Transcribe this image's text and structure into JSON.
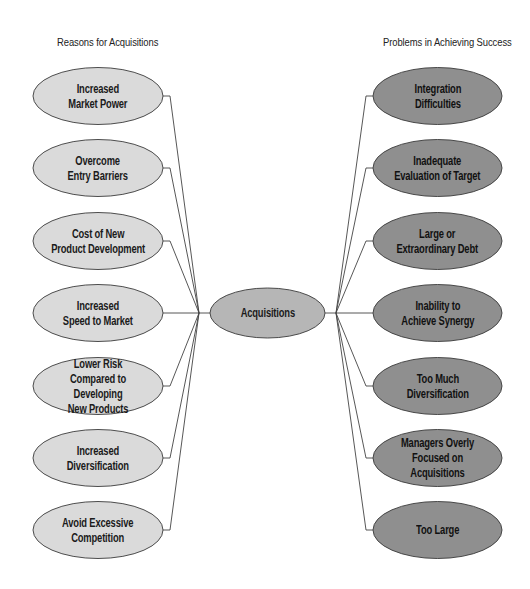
{
  "titles": {
    "left": "Reasons for Acquisitions",
    "right": "Problems in Achieving Success"
  },
  "center": {
    "label": "Acquisitions"
  },
  "colors": {
    "left_fill": "#dadada",
    "right_fill": "#8f8f8f",
    "center_fill": "#b6b6b6",
    "stroke": "#3a3a3a",
    "line": "#444444"
  },
  "left_nodes": [
    {
      "label": "Increased\nMarket Power"
    },
    {
      "label": "Overcome\nEntry Barriers"
    },
    {
      "label": "Cost of New\nProduct Development"
    },
    {
      "label": "Increased\nSpeed to Market"
    },
    {
      "label": "Lower Risk\nCompared to Developing\nNew Products"
    },
    {
      "label": "Increased\nDiversification"
    },
    {
      "label": "Avoid Excessive\nCompetition"
    }
  ],
  "right_nodes": [
    {
      "label": "Integration\nDifficulties"
    },
    {
      "label": "Inadequate\nEvaluation of Target"
    },
    {
      "label": "Large or\nExtraordinary Debt"
    },
    {
      "label": "Inability to\nAchieve Synergy"
    },
    {
      "label": "Too Much\nDiversification"
    },
    {
      "label": "Managers Overly\nFocused on Acquisitions"
    },
    {
      "label": "Too Large"
    }
  ]
}
